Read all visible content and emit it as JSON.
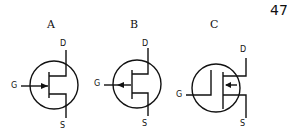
{
  "page_number": "47",
  "symbols": [
    {
      "label": "A",
      "type": "n-channel-jfet",
      "pins": {
        "gate": "G",
        "drain": "D",
        "source": "S"
      },
      "arrow": "inward"
    },
    {
      "label": "B",
      "type": "p-channel-jfet",
      "pins": {
        "gate": "G",
        "drain": "D",
        "source": "S"
      },
      "arrow": "outward"
    },
    {
      "label": "C",
      "type": "mosfet",
      "pins": {
        "gate": "G",
        "drain": "D",
        "source": "S"
      },
      "arrow": "inward"
    }
  ],
  "colors": {
    "ink": "#111111",
    "background": "#ffffff"
  }
}
